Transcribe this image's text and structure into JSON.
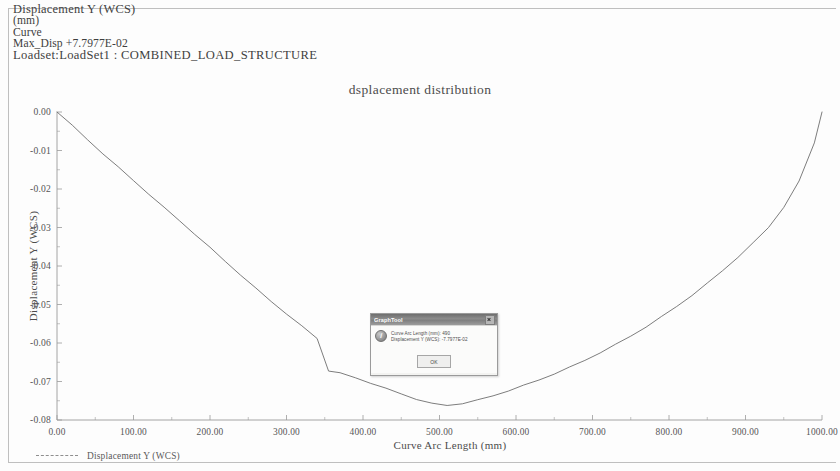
{
  "header": {
    "line1": "Displacement Y (WCS)",
    "line2": "(mm)",
    "line3": "Curve",
    "line4": "Max_Disp  +7.7977E-02",
    "line5": "Loadset:LoadSet1 :  COMBINED_LOAD_STRUCTURE"
  },
  "dialog": {
    "title": "GraphTool",
    "message_line1": "Curve Arc Length (mm): 490",
    "message_line2": "Displacement Y (WCS): -7.7977E-02",
    "ok_label": "OK",
    "close_label": "Close",
    "info_icon": "info-icon"
  },
  "colors": {
    "curve": "#6e6e6e",
    "axis": "#9a9a9a",
    "text": "#4c4c4c",
    "page": "#fdfdfd"
  },
  "chart_data": {
    "type": "line",
    "title": "dsplacement distribution",
    "xlabel": "Curve Arc Length (mm)",
    "ylabel": "Displacement Y (WCS)",
    "xlim": [
      0,
      1000
    ],
    "ylim": [
      -0.08,
      0.0
    ],
    "grid": false,
    "legend_position": "bottom-left",
    "xticks": [
      "0.00",
      "100.00",
      "200.00",
      "300.00",
      "400.00",
      "500.00",
      "600.00",
      "700.00",
      "800.00",
      "900.00",
      "1000.00"
    ],
    "xtick_values": [
      0,
      100,
      200,
      300,
      400,
      500,
      600,
      700,
      800,
      900,
      1000
    ],
    "yticks": [
      "0.00",
      "-0.01",
      "-0.02",
      "-0.03",
      "-0.04",
      "-0.05",
      "-0.06",
      "-0.07",
      "-0.08"
    ],
    "ytick_values": [
      0.0,
      -0.01,
      -0.02,
      -0.03,
      -0.04,
      -0.05,
      -0.06,
      -0.07,
      -0.08
    ],
    "series": [
      {
        "name": "Displacement Y (WCS)",
        "x": [
          0,
          20,
          40,
          60,
          80,
          100,
          120,
          140,
          160,
          180,
          200,
          220,
          240,
          260,
          280,
          300,
          320,
          340,
          355,
          370,
          390,
          410,
          430,
          450,
          470,
          490,
          510,
          530,
          550,
          570,
          590,
          610,
          630,
          650,
          670,
          690,
          710,
          730,
          750,
          770,
          790,
          810,
          830,
          850,
          870,
          890,
          910,
          930,
          950,
          970,
          990,
          1000
        ],
        "y": [
          0.0,
          -0.0035,
          -0.0072,
          -0.0108,
          -0.0143,
          -0.0178,
          -0.0213,
          -0.0248,
          -0.0282,
          -0.0317,
          -0.0352,
          -0.0388,
          -0.0423,
          -0.0458,
          -0.0492,
          -0.0524,
          -0.0556,
          -0.0588,
          -0.0672,
          -0.0678,
          -0.069,
          -0.0704,
          -0.0718,
          -0.0732,
          -0.0746,
          -0.0757,
          -0.0762,
          -0.0757,
          -0.0748,
          -0.0737,
          -0.0724,
          -0.071,
          -0.0696,
          -0.068,
          -0.0663,
          -0.0645,
          -0.0625,
          -0.0604,
          -0.0582,
          -0.0558,
          -0.0532,
          -0.0505,
          -0.0476,
          -0.0445,
          -0.0412,
          -0.0377,
          -0.034,
          -0.03,
          -0.0247,
          -0.018,
          -0.008,
          0.0
        ]
      }
    ],
    "max_disp_label": "Max_Disp  +7.7977E-02"
  }
}
